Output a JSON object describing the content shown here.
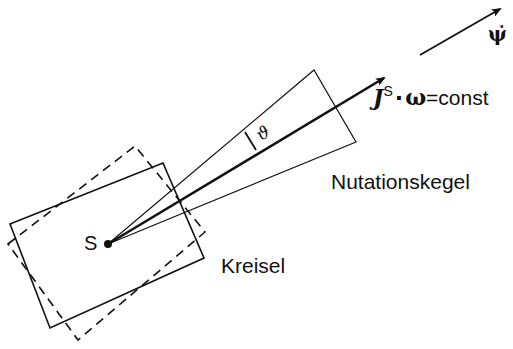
{
  "diagram": {
    "type": "physics-gyroscope-nutation",
    "labels": {
      "psi_dot": "ψ̇",
      "angular_momentum": "J",
      "superscript_s": "S",
      "dot_op": "·",
      "omega": "ω",
      "equals_const": "=const",
      "theta": "ϑ",
      "nutation_cone": "Nutationskegel",
      "gyroscope": "Kreisel",
      "center_point": "S"
    },
    "colors": {
      "stroke": "#111111",
      "background": "#ffffff"
    }
  }
}
